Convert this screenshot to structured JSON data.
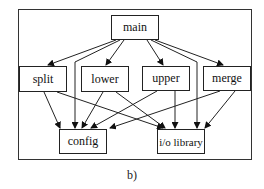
{
  "diagram": {
    "nodes": [
      {
        "id": "main",
        "label": "main"
      },
      {
        "id": "split",
        "label": "split"
      },
      {
        "id": "lower",
        "label": "lower"
      },
      {
        "id": "upper",
        "label": "upper"
      },
      {
        "id": "merge",
        "label": "merge"
      },
      {
        "id": "config",
        "label": "config"
      },
      {
        "id": "io",
        "label": "i/o library"
      }
    ],
    "edges": [
      [
        "main",
        "split"
      ],
      [
        "main",
        "lower"
      ],
      [
        "main",
        "upper"
      ],
      [
        "main",
        "merge"
      ],
      [
        "main",
        "config"
      ],
      [
        "main",
        "io"
      ],
      [
        "split",
        "config"
      ],
      [
        "split",
        "io"
      ],
      [
        "lower",
        "config"
      ],
      [
        "lower",
        "io"
      ],
      [
        "upper",
        "config"
      ],
      [
        "upper",
        "io"
      ],
      [
        "merge",
        "config"
      ],
      [
        "merge",
        "io"
      ]
    ],
    "caption": "b)"
  }
}
